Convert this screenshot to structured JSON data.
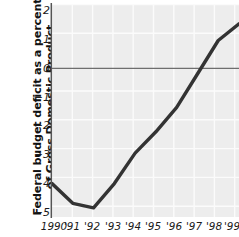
{
  "chart_data": {
    "type": "line",
    "title": "",
    "xlabel": "",
    "ylabel": "Federal budget deficit as a percent of Gross Domestic Product",
    "ylabel_lines": [
      "Federal budget deficit as a percent",
      "of Gross Domestic Product"
    ],
    "categories": [
      "1990",
      "'91",
      "'92",
      "'93",
      "'94",
      "'95",
      "'96",
      "'97",
      "'98",
      "'99"
    ],
    "x": [
      1990,
      1991,
      1992,
      1993,
      1994,
      1995,
      1996,
      1997,
      1998,
      1999
    ],
    "values": [
      -3.9,
      -4.55,
      -4.7,
      -3.9,
      -2.9,
      -2.2,
      -1.4,
      -0.3,
      0.8,
      1.35
    ],
    "yticks": [
      2,
      1,
      0,
      -1,
      -2,
      -3,
      -4,
      -5
    ],
    "ytick_labels": [
      "2",
      "1",
      "0",
      "−1",
      "−2",
      "−3",
      "−4",
      "−5"
    ],
    "ylim": [
      -5,
      2
    ],
    "xlim": [
      1990,
      1999
    ],
    "grid": true,
    "legend": null,
    "zero_line": 0,
    "colors": {
      "plot_background": "#ededed",
      "grid_line": "#fbfbfb",
      "series_line": "#333333",
      "axis_line": "#555555",
      "zero_line": "#6e6e6e",
      "text": "#1a1a1a"
    },
    "series_name": "Federal budget deficit as a percent of GDP"
  }
}
